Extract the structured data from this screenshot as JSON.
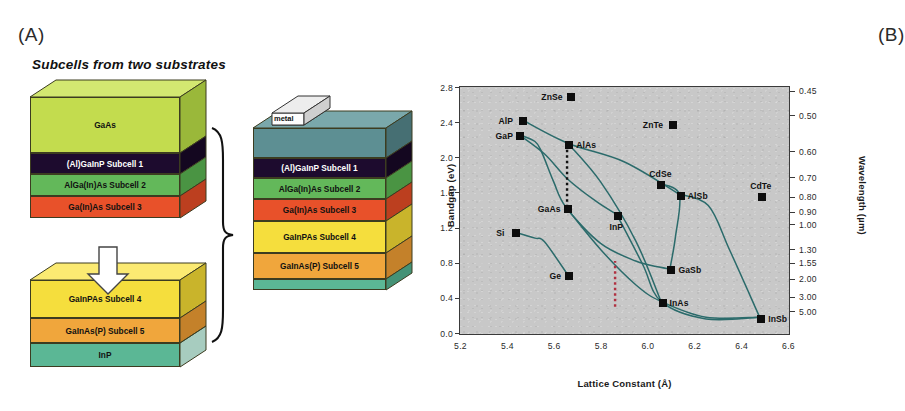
{
  "figure": {
    "panel_a_label": "(A)",
    "panel_b_label": "(B)"
  },
  "panel_a": {
    "title": "Subcells from two substrates",
    "top_stack": {
      "name": "top-substrate-stack",
      "layers": [
        {
          "label": "GaAs",
          "color": "#c3dc4e",
          "top": "#d3e871",
          "side": "#9ab83a",
          "text": "#111111",
          "h": 56
        },
        {
          "label": "(Al)GaInP  Subcell 1",
          "color": "#1d0b2e",
          "top": "#2c1545",
          "side": "#140720",
          "text": "#ffffff",
          "h": 21
        },
        {
          "label": "AlGa(In)As  Subcell 2",
          "color": "#63b85a",
          "top": "#7fcc74",
          "side": "#4a9443",
          "text": "#111111",
          "h": 22
        },
        {
          "label": "Ga(In)As  Subcell 3",
          "color": "#e8512a",
          "top": "#f2714c",
          "side": "#bc3f1f",
          "text": "#111111",
          "h": 22
        }
      ]
    },
    "bottom_stack": {
      "name": "inp-substrate-stack",
      "layers": [
        {
          "label": "GaInPAs  Subcell 4",
          "color": "#f5de3d",
          "top": "#fbea72",
          "side": "#c9b42b",
          "text": "#111111",
          "h": 38
        },
        {
          "label": "GaInAs(P)  Subcell 5",
          "color": "#f0a63c",
          "top": "#f7bb66",
          "side": "#c4812a",
          "text": "#111111",
          "h": 25
        },
        {
          "label": "InP",
          "color": "#5bb795",
          "top": "#78c9ab",
          "side": "#44927678",
          "text": "#111111",
          "h": 24
        }
      ]
    },
    "merged_stack": {
      "name": "merged-five-junction-stack",
      "metal_label": "metal",
      "layers": [
        {
          "label": "",
          "color": "#5d8f93",
          "top": "#7aa8ab",
          "side": "#466f73",
          "text": "#111111",
          "h": 30
        },
        {
          "label": "(Al)GaInP  Subcell 1",
          "color": "#1d0b2e",
          "top": "#2c1545",
          "side": "#140720",
          "text": "#ffffff",
          "h": 20
        },
        {
          "label": "AlGa(In)As  Subcell 2",
          "color": "#63b85a",
          "top": "#7fcc74",
          "side": "#4a9443",
          "text": "#111111",
          "h": 21
        },
        {
          "label": "Ga(In)As  Subcell 3",
          "color": "#e8512a",
          "top": "#f2714c",
          "side": "#bc3f1f",
          "text": "#111111",
          "h": 22
        },
        {
          "label": "GaInPAs  Subcell 4",
          "color": "#f5de3d",
          "top": "#fbea72",
          "side": "#c9b42b",
          "text": "#111111",
          "h": 32
        },
        {
          "label": "GaInAs(P)  Subcell 5",
          "color": "#f0a63c",
          "top": "#f7bb66",
          "side": "#c4812a",
          "text": "#111111",
          "h": 26
        },
        {
          "label": "",
          "color": "#5bb795",
          "top": "#78c9ab",
          "side": "#449276",
          "text": "#111111",
          "h": 11
        }
      ]
    }
  },
  "chart_data": {
    "type": "scatter",
    "title": "",
    "xlabel": "Lattice Constant (Å)",
    "ylabel": "Bandgap (eV)",
    "y2label": "Wavelength (µm)",
    "xlim": [
      5.2,
      6.6
    ],
    "ylim": [
      0.0,
      2.8
    ],
    "grid": false,
    "legend": "none",
    "xticks": [
      "5.2",
      "5.4",
      "5.6",
      "5.8",
      "6.0",
      "6.2",
      "6.4",
      "6.6"
    ],
    "xtick_values": [
      5.2,
      5.4,
      5.6,
      5.8,
      6.0,
      6.2,
      6.4,
      6.6
    ],
    "yticks": [
      "0.0",
      "0.4",
      "0.8",
      "1.2",
      "1.6",
      "2.0",
      "2.4",
      "2.8"
    ],
    "ytick_values": [
      0.0,
      0.4,
      0.8,
      1.2,
      1.6,
      2.0,
      2.4,
      2.8
    ],
    "wavelength_ticks": [
      "0.45",
      "0.50",
      "0.60",
      "0.70",
      "0.80",
      "0.90",
      "1.00",
      "1.30",
      "1.55",
      "2.00",
      "3.00",
      "5.00"
    ],
    "wavelength_tick_ev": [
      2.755,
      2.48,
      2.066,
      1.771,
      1.55,
      1.378,
      1.24,
      0.954,
      0.8,
      0.62,
      0.413,
      0.248
    ],
    "points": [
      {
        "name": "ZnSe",
        "x": 5.668,
        "y": 2.7,
        "label_pos": "left"
      },
      {
        "name": "AlP",
        "x": 5.463,
        "y": 2.43,
        "label_pos": "left"
      },
      {
        "name": "GaP",
        "x": 5.45,
        "y": 2.26,
        "label_pos": "left"
      },
      {
        "name": "AlAs",
        "x": 5.66,
        "y": 2.16,
        "label_pos": "right"
      },
      {
        "name": "ZnTe",
        "x": 6.101,
        "y": 2.38,
        "label_pos": "left"
      },
      {
        "name": "CdSe",
        "x": 6.05,
        "y": 1.7,
        "label_pos": "above"
      },
      {
        "name": "AlSb",
        "x": 6.136,
        "y": 1.58,
        "label_pos": "right"
      },
      {
        "name": "CdTe",
        "x": 6.481,
        "y": 1.56,
        "label_pos": "above"
      },
      {
        "name": "GaAs",
        "x": 5.653,
        "y": 1.43,
        "label_pos": "left"
      },
      {
        "name": "InP",
        "x": 5.869,
        "y": 1.35,
        "label_pos": "below"
      },
      {
        "name": "Si",
        "x": 5.431,
        "y": 1.15,
        "label_pos": "left"
      },
      {
        "name": "Ge",
        "x": 5.658,
        "y": 0.67,
        "label_pos": "left"
      },
      {
        "name": "GaSb",
        "x": 6.096,
        "y": 0.73,
        "label_pos": "right"
      },
      {
        "name": "InAs",
        "x": 6.058,
        "y": 0.36,
        "label_pos": "right"
      },
      {
        "name": "InSb",
        "x": 6.479,
        "y": 0.18,
        "label_pos": "right"
      }
    ],
    "alloy_curves": [
      {
        "name": "AlP-AlAs-AlSb",
        "points": [
          [
            5.463,
            2.43
          ],
          [
            5.66,
            2.16
          ],
          [
            5.9,
            1.95
          ],
          [
            6.136,
            1.58
          ]
        ]
      },
      {
        "name": "GaP-GaAs-GaSb",
        "points": [
          [
            5.45,
            2.26
          ],
          [
            5.52,
            2.18
          ],
          [
            5.55,
            2.05
          ],
          [
            5.6,
            1.72
          ],
          [
            5.653,
            1.43
          ],
          [
            5.8,
            1.02
          ],
          [
            5.95,
            0.82
          ],
          [
            6.05,
            0.75
          ],
          [
            6.096,
            0.73
          ]
        ]
      },
      {
        "name": "GaP-AlAs-InP",
        "points": [
          [
            5.45,
            2.26
          ],
          [
            5.56,
            2.04
          ],
          [
            5.66,
            1.75
          ],
          [
            5.78,
            1.5
          ],
          [
            5.869,
            1.35
          ]
        ]
      },
      {
        "name": "AlAs-InAs",
        "points": [
          [
            5.66,
            2.16
          ],
          [
            5.8,
            1.72
          ],
          [
            5.95,
            1.05
          ],
          [
            6.058,
            0.36
          ]
        ]
      },
      {
        "name": "InP-InAs-InSb",
        "points": [
          [
            5.869,
            1.35
          ],
          [
            5.98,
            0.78
          ],
          [
            6.058,
            0.36
          ],
          [
            6.25,
            0.16
          ],
          [
            6.479,
            0.18
          ]
        ]
      },
      {
        "name": "GaAs-InAs-InSb",
        "points": [
          [
            5.653,
            1.43
          ],
          [
            5.8,
            0.95
          ],
          [
            5.95,
            0.55
          ],
          [
            6.058,
            0.36
          ],
          [
            6.25,
            0.18
          ],
          [
            6.479,
            0.18
          ]
        ]
      },
      {
        "name": "AlSb-InSb",
        "points": [
          [
            6.136,
            1.58
          ],
          [
            6.26,
            1.45
          ],
          [
            6.35,
            0.95
          ],
          [
            6.479,
            0.18
          ]
        ]
      },
      {
        "name": "Si-Ge",
        "points": [
          [
            5.431,
            1.15
          ],
          [
            5.52,
            1.08
          ],
          [
            5.56,
            1.04
          ],
          [
            5.658,
            0.67
          ]
        ]
      },
      {
        "name": "CdSe-AlSb-GaSb",
        "points": [
          [
            6.05,
            1.7
          ],
          [
            6.136,
            1.58
          ],
          [
            6.12,
            1.1
          ],
          [
            6.096,
            0.73
          ]
        ]
      }
    ],
    "guides": [
      {
        "name": "gaas-alas-lattice-match",
        "type": "vertical-dotted",
        "x": 5.657,
        "y_from": 1.43,
        "y_to": 2.16,
        "color": "#111111"
      },
      {
        "name": "inp-lattice-match",
        "type": "vertical-dotted",
        "x": 5.862,
        "y_from": 0.3,
        "y_to": 0.82,
        "color": "#b03040"
      }
    ]
  }
}
